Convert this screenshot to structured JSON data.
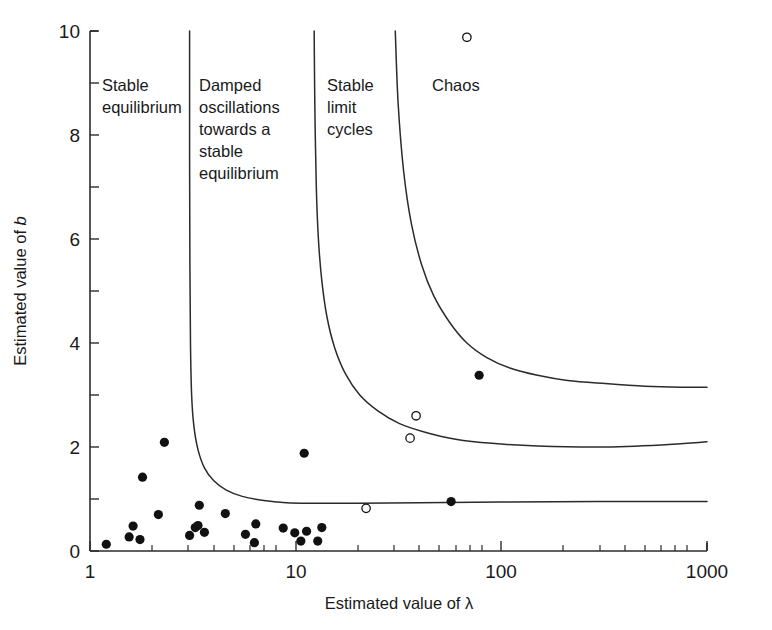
{
  "chart_data": {
    "type": "scatter",
    "title": "",
    "xlabel": "Estimated value of λ",
    "ylabel": "Estimated value of b",
    "xscale": "log",
    "yscale": "linear",
    "xlim": [
      1,
      1000
    ],
    "ylim": [
      0,
      10
    ],
    "grid": false,
    "legend": "none",
    "xticks": [
      1,
      10,
      100,
      1000
    ],
    "xtick_labels": [
      "1",
      "10",
      "100",
      "1000"
    ],
    "yticks": [
      0,
      1,
      2,
      3,
      4,
      5,
      6,
      7,
      8,
      9,
      10
    ],
    "ytick_labels": [
      "0",
      "",
      "2",
      "",
      "4",
      "",
      "6",
      "",
      "8",
      "",
      "10"
    ],
    "ytick_labels_shown": [
      "0",
      "2",
      "4",
      "6",
      "8",
      "10"
    ],
    "annotations": [
      {
        "text": "Stable equilibrium",
        "lines": [
          "Stable",
          "equilibrium"
        ],
        "x": 1.35,
        "y": 9.1
      },
      {
        "text": "Damped oscillations towards a stable equilibrium",
        "lines": [
          "Damped",
          "oscillations",
          "towards a",
          "stable",
          "equilibrium"
        ],
        "x": 3.9,
        "y": 9.1
      },
      {
        "text": "Stable limit cycles",
        "lines": [
          "Stable",
          "limit",
          "cycles"
        ],
        "x": 13.5,
        "y": 9.1
      },
      {
        "text": "Chaos",
        "lines": [
          "Chaos"
        ],
        "x": 55,
        "y": 9.1
      }
    ],
    "boundary_curves": [
      {
        "name": "stable-equilibrium-boundary",
        "description": "Left boundary: stable equilibrium to damped oscillations",
        "points": [
          [
            3.05,
            10.0
          ],
          [
            3.05,
            7.5
          ],
          [
            3.06,
            5.5
          ],
          [
            3.08,
            4.0
          ],
          [
            3.12,
            3.0
          ],
          [
            3.2,
            2.4
          ],
          [
            3.35,
            1.95
          ],
          [
            3.6,
            1.6
          ],
          [
            4.0,
            1.35
          ],
          [
            4.6,
            1.17
          ],
          [
            5.5,
            1.05
          ],
          [
            7.0,
            0.97
          ],
          [
            9.0,
            0.93
          ],
          [
            12.0,
            0.92
          ],
          [
            20.0,
            0.92
          ],
          [
            40.0,
            0.93
          ],
          [
            100.0,
            0.94
          ],
          [
            300.0,
            0.95
          ],
          [
            1000.0,
            0.95
          ]
        ]
      },
      {
        "name": "damped-to-limit-cycle-boundary",
        "description": "Middle boundary: damped oscillations to stable limit cycles",
        "points": [
          [
            12.3,
            10.0
          ],
          [
            12.4,
            8.5
          ],
          [
            12.6,
            7.0
          ],
          [
            12.9,
            6.0
          ],
          [
            13.4,
            5.2
          ],
          [
            14.2,
            4.5
          ],
          [
            15.5,
            3.9
          ],
          [
            17.5,
            3.4
          ],
          [
            20.5,
            3.0
          ],
          [
            25.0,
            2.7
          ],
          [
            32.0,
            2.45
          ],
          [
            43.0,
            2.28
          ],
          [
            60.0,
            2.15
          ],
          [
            90.0,
            2.07
          ],
          [
            150.0,
            2.02
          ],
          [
            300.0,
            2.0
          ],
          [
            600.0,
            2.04
          ],
          [
            1000.0,
            2.1
          ]
        ]
      },
      {
        "name": "limit-cycle-to-chaos-boundary",
        "description": "Right boundary: stable limit cycles to chaos",
        "points": [
          [
            30.5,
            10.0
          ],
          [
            31.5,
            8.6
          ],
          [
            33.5,
            7.3
          ],
          [
            36.5,
            6.3
          ],
          [
            41.0,
            5.5
          ],
          [
            47.0,
            4.9
          ],
          [
            56.0,
            4.4
          ],
          [
            68.0,
            4.0
          ],
          [
            85.0,
            3.72
          ],
          [
            110.0,
            3.52
          ],
          [
            150.0,
            3.38
          ],
          [
            210.0,
            3.28
          ],
          [
            320.0,
            3.22
          ],
          [
            500.0,
            3.17
          ],
          [
            750.0,
            3.15
          ],
          [
            1000.0,
            3.15
          ]
        ]
      }
    ],
    "series": [
      {
        "name": "Estimated populations (filled circles)",
        "marker": "filled-circle",
        "color": "#111111",
        "points": [
          [
            1.2,
            0.13
          ],
          [
            1.55,
            0.27
          ],
          [
            1.62,
            0.48
          ],
          [
            1.75,
            0.22
          ],
          [
            1.8,
            1.42
          ],
          [
            2.15,
            0.7
          ],
          [
            2.3,
            2.09
          ],
          [
            3.05,
            0.3
          ],
          [
            3.25,
            0.45
          ],
          [
            3.35,
            0.49
          ],
          [
            3.4,
            0.88
          ],
          [
            3.6,
            0.36
          ],
          [
            4.55,
            0.72
          ],
          [
            5.7,
            0.32
          ],
          [
            6.3,
            0.16
          ],
          [
            6.4,
            0.52
          ],
          [
            8.7,
            0.44
          ],
          [
            9.9,
            0.35
          ],
          [
            10.6,
            0.19
          ],
          [
            11.0,
            1.88
          ],
          [
            11.3,
            0.38
          ],
          [
            12.8,
            0.19
          ],
          [
            13.4,
            0.45
          ],
          [
            57.0,
            0.95
          ],
          [
            78.0,
            3.38
          ]
        ]
      },
      {
        "name": "Estimated populations (open circles)",
        "marker": "open-circle",
        "color": "#111111",
        "points": [
          [
            22.0,
            0.82
          ],
          [
            36.0,
            2.17
          ],
          [
            38.5,
            2.6
          ],
          [
            68.0,
            9.88
          ]
        ]
      }
    ]
  },
  "axes": {
    "x_label": "Estimated value of λ",
    "y_label_prefix": "Estimated value of ",
    "y_label_symbol": "b"
  }
}
